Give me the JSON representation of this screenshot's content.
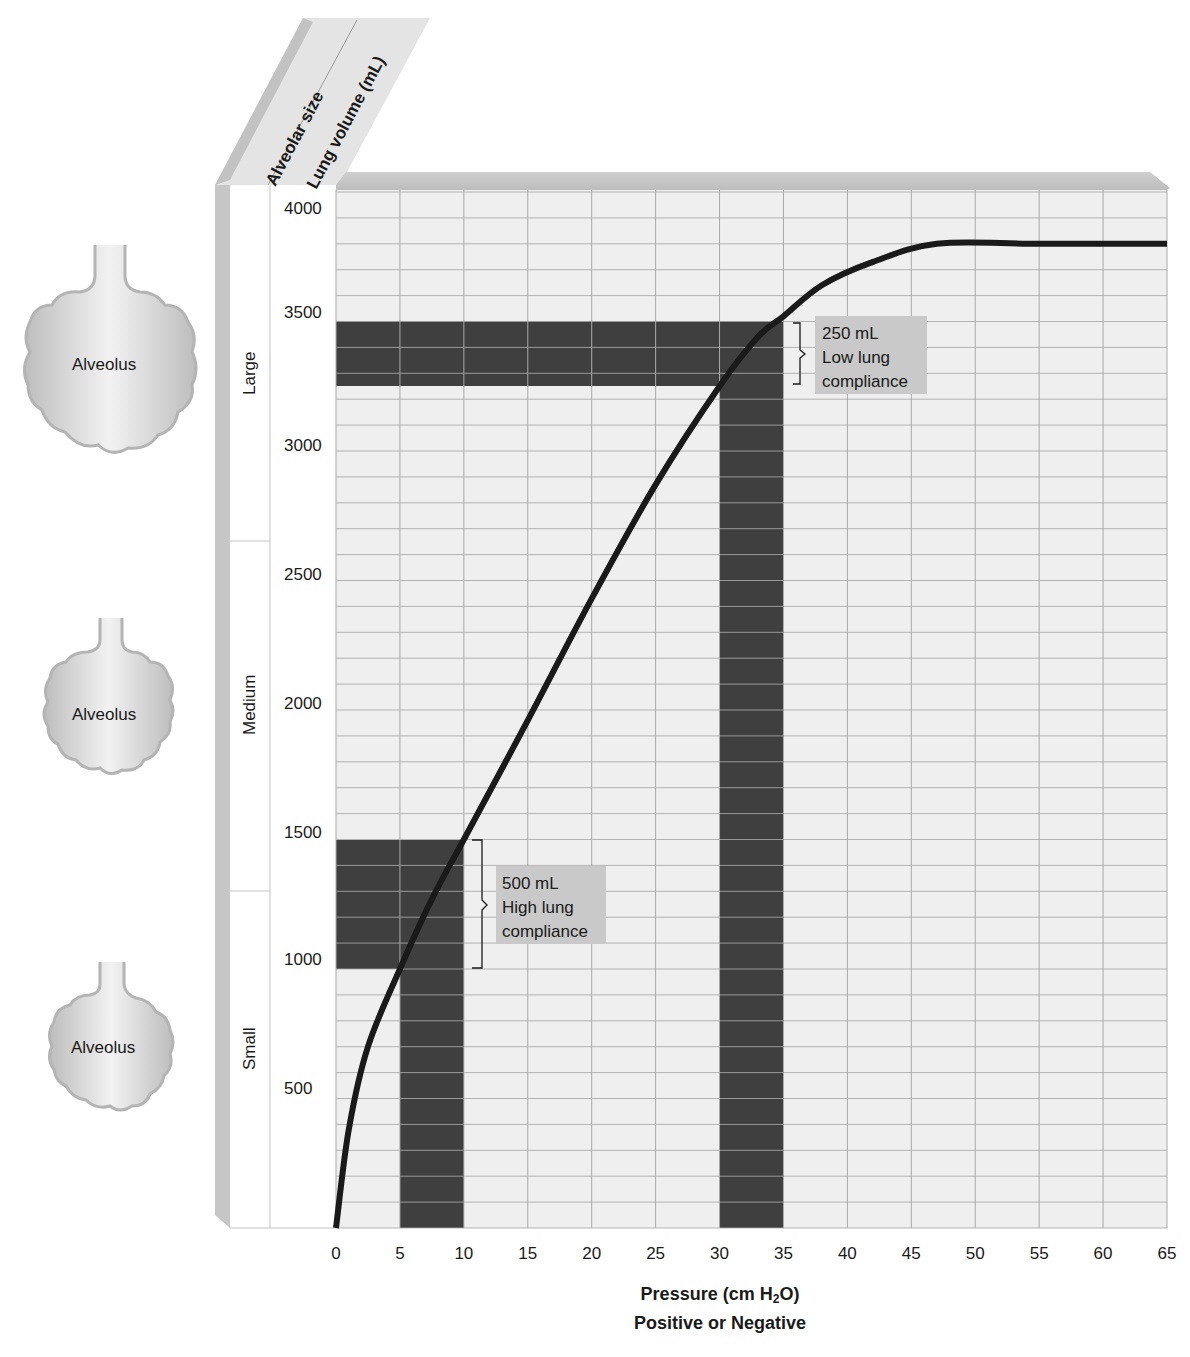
{
  "chart_data": {
    "type": "line",
    "title": "",
    "xlabel": "Pressure (cm H2O)",
    "xlabel_parts": {
      "main": "Pressure (cm H",
      "sub": "2",
      "end": "O)"
    },
    "xlabel_line2": "Positive or Negative",
    "ylabel": "Lung volume (mL)",
    "ylabel_secondary": "Alveolar size",
    "xlim": [
      0,
      65
    ],
    "ylim": [
      0,
      4000
    ],
    "x_ticks": [
      0,
      5,
      10,
      15,
      20,
      25,
      30,
      35,
      40,
      45,
      50,
      55,
      60,
      65
    ],
    "y_ticks": [
      500,
      1000,
      1500,
      2000,
      2500,
      3000,
      3500,
      4000
    ],
    "grid": true,
    "grid_minor_y_step": 100,
    "grid_x_step": 5,
    "series": [
      {
        "name": "Lung compliance curve",
        "x": [
          0,
          1,
          2.5,
          5,
          7.5,
          10,
          15,
          20,
          25,
          30,
          33,
          35,
          38,
          42,
          47,
          55,
          65
        ],
        "y": [
          0,
          380,
          700,
          1000,
          1270,
          1500,
          1960,
          2430,
          2870,
          3250,
          3440,
          3520,
          3640,
          3730,
          3800,
          3800,
          3800
        ]
      }
    ],
    "size_bands": [
      {
        "label": "Small",
        "from": 0,
        "to": 1300
      },
      {
        "label": "Medium",
        "from": 1300,
        "to": 2650
      },
      {
        "label": "Large",
        "from": 2650,
        "to": 4000
      }
    ],
    "highlight_regions": [
      {
        "name": "high-compliance",
        "x_band": [
          5,
          10
        ],
        "y_band": [
          1000,
          1500
        ],
        "delta_volume": "500 mL"
      },
      {
        "name": "low-compliance",
        "x_band": [
          30,
          35
        ],
        "y_band": [
          3250,
          3500
        ],
        "delta_volume": "250 mL"
      }
    ],
    "annotations": [
      {
        "text": [
          "250 mL",
          "Low lung",
          "compliance"
        ],
        "at": [
          37,
          3400
        ]
      },
      {
        "text": [
          "500 mL",
          "High lung",
          "compliance"
        ],
        "at": [
          13,
          1250
        ]
      }
    ]
  },
  "header": {
    "alveolar_size": "Alveolar size",
    "lung_volume": "Lung volume (mL)"
  },
  "size_labels": {
    "large": "Large",
    "medium": "Medium",
    "small": "Small"
  },
  "y_tick_labels": [
    "4000",
    "3500",
    "3000",
    "2500",
    "2000",
    "1500",
    "1000",
    "500"
  ],
  "x_tick_labels": [
    "0",
    "5",
    "10",
    "15",
    "20",
    "25",
    "30",
    "35",
    "40",
    "45",
    "50",
    "55",
    "60",
    "65"
  ],
  "alveoli": [
    {
      "label": "Alveolus",
      "size": "large"
    },
    {
      "label": "Alveolus",
      "size": "medium"
    },
    {
      "label": "Alveolus",
      "size": "small"
    }
  ],
  "annotation_low": {
    "line1": "250 mL",
    "line2": "Low lung",
    "line3": "compliance"
  },
  "annotation_high": {
    "line1": "500 mL",
    "line2": "High lung",
    "line3": "compliance"
  },
  "colors": {
    "grid_bg": "#efefef",
    "grid_line": "#a9a9a9",
    "band": "#3f3f3f",
    "curve": "#1a1a1a",
    "frame_shadow": "#c8c8c8",
    "annotation_bg": "#c9c9c9",
    "alveolus_fill": "#d6d6d6"
  }
}
